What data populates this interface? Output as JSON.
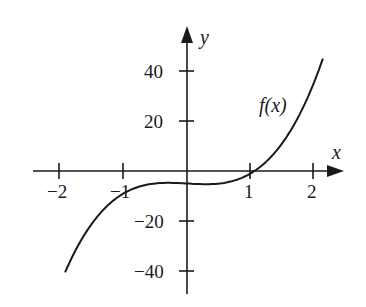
{
  "chart_data": {
    "type": "line",
    "title": "",
    "xlabel": "x",
    "ylabel": "y",
    "xlim": [
      -2.3,
      2.4
    ],
    "ylim": [
      -48,
      52
    ],
    "grid": false,
    "legend": null,
    "x_ticks": [
      -2,
      -1,
      1,
      2
    ],
    "x_tick_labels": [
      "−2",
      "−1",
      "1",
      "2"
    ],
    "y_ticks": [
      40,
      20,
      -20,
      -40
    ],
    "y_tick_labels": [
      "40",
      "20",
      "−20",
      "−40"
    ],
    "annotations": [
      {
        "text": "f(x)",
        "x": 1.55,
        "y": 25
      }
    ],
    "series": [
      {
        "name": "f(x)",
        "x": [
          -1.92,
          -1.5,
          -1.0,
          -0.5,
          0,
          0.5,
          1.0,
          1.1,
          1.5,
          2.0,
          2.14
        ],
        "values": [
          -40.5,
          -20.1,
          -9.0,
          -5.0,
          -5.0,
          -5.0,
          -1.0,
          0.6,
          11.1,
          35.4,
          45.0
        ]
      }
    ]
  },
  "labels": {
    "x_axis": "x",
    "y_axis": "y",
    "curve": "f(x)",
    "xt": [
      "−2",
      "−1",
      "1",
      "2"
    ],
    "yt": [
      "40",
      "20",
      "−20",
      "−40"
    ]
  }
}
